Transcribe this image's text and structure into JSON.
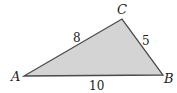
{
  "diagram": {
    "type": "triangle",
    "fill_color": "#d4d4d4",
    "stroke_color": "#4a4a4a",
    "vertices": [
      {
        "name": "A",
        "x": 24,
        "y": 76
      },
      {
        "name": "B",
        "x": 163,
        "y": 75
      },
      {
        "name": "C",
        "x": 122,
        "y": 19
      }
    ],
    "sides": [
      {
        "between": "AC",
        "length": "8"
      },
      {
        "between": "CB",
        "length": "5"
      },
      {
        "between": "AB",
        "length": "10"
      }
    ]
  }
}
